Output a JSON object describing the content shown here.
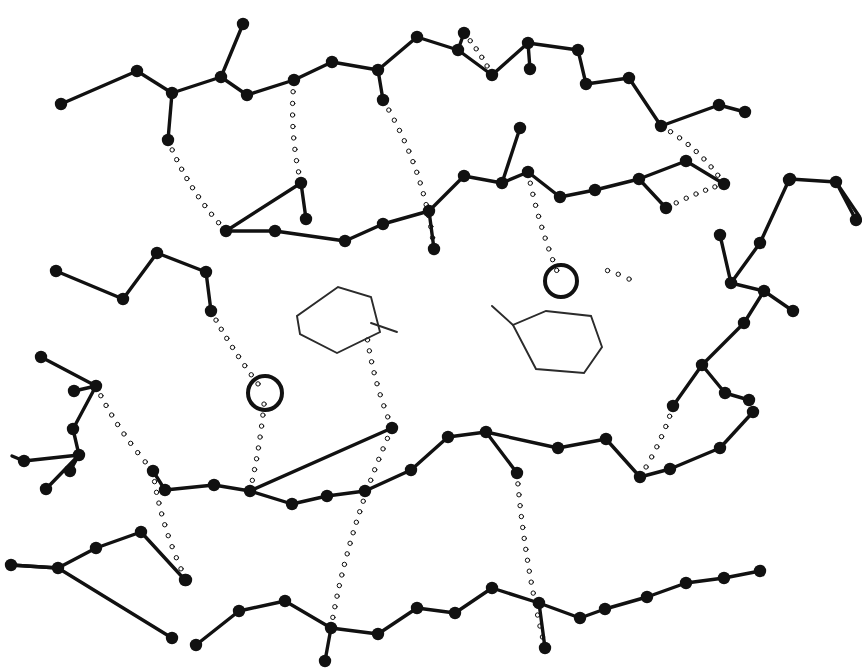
{
  "figure": {
    "domain": "Diagram",
    "width": 862,
    "height": 672,
    "background_color": "#ffffff",
    "ink_color": "#111111",
    "ring_color": "#2b2b2b"
  },
  "style": {
    "bond_width": 3.4,
    "atom_radius": 6.2,
    "hbond_dot_radius": 2.2,
    "hbond_dot_gap": 11,
    "ring_stroke_width": 1.9,
    "water_stroke_width": 4.0,
    "water_radius": 16
  },
  "legend": {
    "atom_label": "atom node",
    "bond_label": "covalent bond",
    "hbond_label": "hydrogen bond (dotted)",
    "ring_label": "six-membered ring",
    "water_label": "water molecule (open circle)"
  },
  "counts": {
    "atoms": 132,
    "bonds": 128,
    "hydrogen_bonds": 14,
    "rings": 2,
    "water_molecules": 2
  },
  "chains": [
    {
      "name": "chain-top",
      "atoms": [
        [
          61,
          104
        ],
        [
          137,
          71
        ],
        [
          172,
          93
        ],
        [
          168,
          140
        ],
        [
          221,
          77
        ],
        [
          243,
          24
        ],
        [
          247,
          95
        ],
        [
          294,
          80
        ],
        [
          332,
          62
        ],
        [
          378,
          70
        ],
        [
          383,
          100
        ],
        [
          417,
          37
        ],
        [
          458,
          50
        ],
        [
          464,
          33
        ],
        [
          492,
          75
        ],
        [
          528,
          43
        ],
        [
          530,
          69
        ],
        [
          578,
          50
        ],
        [
          586,
          84
        ],
        [
          629,
          78
        ],
        [
          661,
          126
        ],
        [
          719,
          105
        ],
        [
          745,
          112
        ]
      ],
      "bonds": [
        [
          0,
          1
        ],
        [
          1,
          2
        ],
        [
          2,
          3
        ],
        [
          2,
          4
        ],
        [
          4,
          5
        ],
        [
          4,
          6
        ],
        [
          6,
          7
        ],
        [
          7,
          8
        ],
        [
          8,
          9
        ],
        [
          9,
          10
        ],
        [
          9,
          11
        ],
        [
          11,
          12
        ],
        [
          12,
          13
        ],
        [
          12,
          14
        ],
        [
          14,
          15
        ],
        [
          15,
          16
        ],
        [
          15,
          17
        ],
        [
          17,
          18
        ],
        [
          18,
          19
        ],
        [
          19,
          20
        ],
        [
          20,
          21
        ],
        [
          21,
          22
        ]
      ]
    },
    {
      "name": "chain-upper-middle",
      "atoms": [
        [
          226,
          231
        ],
        [
          275,
          231
        ],
        [
          301,
          183
        ],
        [
          306,
          219
        ],
        [
          345,
          241
        ],
        [
          383,
          224
        ],
        [
          429,
          211
        ],
        [
          434,
          249
        ],
        [
          464,
          176
        ],
        [
          502,
          183
        ],
        [
          520,
          128
        ],
        [
          528,
          172
        ],
        [
          560,
          197
        ],
        [
          595,
          190
        ],
        [
          639,
          179
        ],
        [
          666,
          208
        ],
        [
          686,
          161
        ],
        [
          724,
          184
        ],
        [
          790,
          179
        ],
        [
          836,
          182
        ],
        [
          856,
          220
        ]
      ],
      "bonds": [
        [
          0,
          1
        ],
        [
          0,
          2
        ],
        [
          2,
          3
        ],
        [
          1,
          4
        ],
        [
          4,
          5
        ],
        [
          5,
          6
        ],
        [
          6,
          7
        ],
        [
          6,
          8
        ],
        [
          8,
          9
        ],
        [
          9,
          10
        ],
        [
          9,
          11
        ],
        [
          11,
          12
        ],
        [
          12,
          13
        ],
        [
          13,
          14
        ],
        [
          14,
          15
        ],
        [
          14,
          16
        ],
        [
          16,
          17
        ],
        [
          18,
          19
        ],
        [
          19,
          20
        ]
      ]
    },
    {
      "name": "chain-left-upper",
      "atoms": [
        [
          56,
          271
        ],
        [
          123,
          299
        ],
        [
          157,
          253
        ],
        [
          206,
          272
        ],
        [
          211,
          311
        ]
      ],
      "bonds": [
        [
          0,
          1
        ],
        [
          1,
          2
        ],
        [
          2,
          3
        ],
        [
          3,
          4
        ]
      ]
    },
    {
      "name": "chain-left-lower",
      "atoms": [
        [
          41,
          357
        ],
        [
          74,
          391
        ],
        [
          96,
          386
        ],
        [
          73,
          429
        ],
        [
          79,
          455
        ],
        [
          24,
          461
        ],
        [
          46,
          489
        ],
        [
          70,
          471
        ]
      ],
      "bonds": [
        [
          0,
          2
        ],
        [
          1,
          2
        ],
        [
          2,
          3
        ],
        [
          3,
          4
        ],
        [
          4,
          5
        ],
        [
          4,
          6
        ],
        [
          4,
          7
        ]
      ]
    },
    {
      "name": "chain-right-upper",
      "atoms": [
        [
          720,
          235
        ],
        [
          731,
          283
        ],
        [
          760,
          243
        ],
        [
          789,
          180
        ],
        [
          764,
          291
        ],
        [
          793,
          311
        ],
        [
          744,
          323
        ],
        [
          702,
          365
        ],
        [
          673,
          406
        ],
        [
          725,
          393
        ],
        [
          749,
          400
        ]
      ],
      "bonds": [
        [
          0,
          1
        ],
        [
          1,
          2
        ],
        [
          2,
          3
        ],
        [
          1,
          4
        ],
        [
          4,
          5
        ],
        [
          4,
          6
        ],
        [
          6,
          7
        ],
        [
          7,
          8
        ],
        [
          7,
          9
        ],
        [
          9,
          10
        ]
      ]
    },
    {
      "name": "chain-middle",
      "atoms": [
        [
          153,
          471
        ],
        [
          165,
          490
        ],
        [
          214,
          485
        ],
        [
          250,
          491
        ],
        [
          292,
          504
        ],
        [
          327,
          496
        ],
        [
          365,
          491
        ],
        [
          392,
          428
        ],
        [
          411,
          470
        ],
        [
          448,
          437
        ],
        [
          486,
          432
        ],
        [
          517,
          473
        ],
        [
          558,
          448
        ],
        [
          606,
          439
        ],
        [
          640,
          477
        ],
        [
          670,
          469
        ],
        [
          720,
          448
        ],
        [
          753,
          412
        ]
      ],
      "bonds": [
        [
          0,
          1
        ],
        [
          1,
          2
        ],
        [
          2,
          3
        ],
        [
          3,
          4
        ],
        [
          4,
          5
        ],
        [
          3,
          7
        ],
        [
          5,
          6
        ],
        [
          6,
          8
        ],
        [
          8,
          9
        ],
        [
          9,
          10
        ],
        [
          10,
          11
        ],
        [
          10,
          12
        ],
        [
          12,
          13
        ],
        [
          13,
          14
        ],
        [
          14,
          15
        ],
        [
          15,
          16
        ],
        [
          16,
          17
        ]
      ]
    },
    {
      "name": "chain-bottom-left",
      "atoms": [
        [
          11,
          565
        ],
        [
          58,
          568
        ],
        [
          96,
          548
        ],
        [
          141,
          532
        ],
        [
          185,
          580
        ],
        [
          172,
          638
        ]
      ],
      "bonds": [
        [
          0,
          1
        ],
        [
          1,
          2
        ],
        [
          2,
          3
        ],
        [
          1,
          5
        ],
        [
          3,
          4
        ]
      ]
    },
    {
      "name": "chain-bottom",
      "atoms": [
        [
          186,
          580
        ],
        [
          239,
          611
        ],
        [
          196,
          645
        ],
        [
          285,
          601
        ],
        [
          331,
          628
        ],
        [
          325,
          661
        ],
        [
          378,
          634
        ],
        [
          417,
          608
        ],
        [
          455,
          613
        ],
        [
          492,
          588
        ],
        [
          539,
          603
        ],
        [
          545,
          648
        ],
        [
          580,
          618
        ],
        [
          605,
          609
        ],
        [
          647,
          597
        ],
        [
          686,
          583
        ],
        [
          724,
          578
        ],
        [
          760,
          571
        ]
      ],
      "bonds": [
        [
          1,
          2
        ],
        [
          1,
          3
        ],
        [
          3,
          4
        ],
        [
          4,
          5
        ],
        [
          4,
          6
        ],
        [
          6,
          7
        ],
        [
          7,
          8
        ],
        [
          8,
          9
        ],
        [
          9,
          10
        ],
        [
          10,
          11
        ],
        [
          10,
          12
        ],
        [
          12,
          13
        ],
        [
          13,
          14
        ],
        [
          14,
          15
        ],
        [
          15,
          16
        ],
        [
          16,
          17
        ]
      ]
    }
  ],
  "hydrogen_bonds": [
    {
      "name": "hbond-1",
      "from": [
        168,
        140
      ],
      "to": [
        226,
        231
      ],
      "curve": [
        188,
        190
      ]
    },
    {
      "name": "hbond-2",
      "from": [
        294,
        80
      ],
      "to": [
        301,
        183
      ],
      "curve": [
        289,
        133
      ]
    },
    {
      "name": "hbond-3",
      "from": [
        434,
        249
      ],
      "to": [
        383,
        100
      ],
      "curve": [
        425,
        170
      ]
    },
    {
      "name": "hbond-4",
      "from": [
        492,
        75
      ],
      "to": [
        464,
        33
      ],
      "curve": [
        480,
        52
      ]
    },
    {
      "name": "hbond-5",
      "from": [
        661,
        126
      ],
      "to": [
        724,
        184
      ],
      "curve": [
        700,
        148
      ]
    },
    {
      "name": "hbond-6",
      "from": [
        528,
        172
      ],
      "to": [
        561,
        281
      ],
      "curve": [
        539,
        228
      ]
    },
    {
      "name": "hbond-7",
      "from": [
        211,
        311
      ],
      "to": [
        265,
        393
      ],
      "curve": [
        233,
        352
      ]
    },
    {
      "name": "hbond-8",
      "from": [
        265,
        393
      ],
      "to": [
        250,
        491
      ],
      "curve": [
        261,
        443
      ]
    },
    {
      "name": "hbond-9",
      "from": [
        96,
        386
      ],
      "to": [
        153,
        471
      ],
      "curve": [
        117,
        430
      ]
    },
    {
      "name": "hbond-10",
      "from": [
        366,
        329
      ],
      "to": [
        392,
        428
      ],
      "curve": [
        372,
        378
      ]
    },
    {
      "name": "hbond-11",
      "from": [
        666,
        208
      ],
      "to": [
        724,
        184
      ],
      "curve": [
        697,
        192
      ]
    },
    {
      "name": "hbond-12",
      "from": [
        153,
        471
      ],
      "to": [
        186,
        580
      ],
      "curve": [
        160,
        524
      ]
    },
    {
      "name": "hbond-13",
      "from": [
        331,
        628
      ],
      "to": [
        392,
        428
      ],
      "curve": [
        348,
        527
      ]
    },
    {
      "name": "hbond-14",
      "from": [
        517,
        473
      ],
      "to": [
        545,
        648
      ],
      "curve": [
        524,
        560
      ]
    },
    {
      "name": "hbond-15",
      "from": [
        673,
        406
      ],
      "to": [
        640,
        477
      ],
      "curve": [
        662,
        442
      ]
    },
    {
      "name": "hbond-16",
      "from": [
        597,
        268
      ],
      "to": [
        640,
        285
      ],
      "curve": [
        618,
        272
      ]
    }
  ],
  "rings": [
    {
      "name": "ring-left-phenyl",
      "vertices": [
        [
          297,
          316
        ],
        [
          300,
          334
        ],
        [
          337,
          353
        ],
        [
          380,
          332
        ],
        [
          371,
          297
        ],
        [
          338,
          287
        ]
      ],
      "substituent_bond": [
        [
          371,
          323
        ],
        [
          397,
          332
        ]
      ],
      "orientation": "edge-on"
    },
    {
      "name": "ring-right-cyclohexane",
      "vertices": [
        [
          513,
          325
        ],
        [
          536,
          369
        ],
        [
          584,
          373
        ],
        [
          602,
          347
        ],
        [
          591,
          316
        ],
        [
          546,
          311
        ]
      ],
      "substituent_bond": [
        [
          513,
          325
        ],
        [
          492,
          306
        ]
      ],
      "orientation": "chair-projection"
    }
  ],
  "water_molecules": [
    {
      "name": "water-left",
      "center": [
        265,
        393
      ],
      "radius": 17
    },
    {
      "name": "water-right",
      "center": [
        561,
        281
      ],
      "radius": 16
    }
  ],
  "terminal_stubs": [
    {
      "name": "stub-left-edge-1",
      "from": [
        24,
        461
      ],
      "to": [
        12,
        456
      ]
    },
    {
      "name": "stub-right-edge-1",
      "from": [
        836,
        182
      ],
      "to": [
        859,
        216
      ]
    },
    {
      "name": "stub-left-bottom",
      "from": [
        11,
        565
      ],
      "to": [
        58,
        568
      ]
    }
  ]
}
